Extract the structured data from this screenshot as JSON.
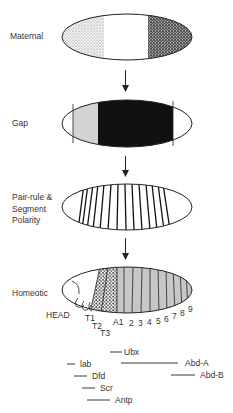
{
  "stages": [
    {
      "label": "Maternal",
      "regions": [
        "light-stipple",
        "white",
        "dark-stipple"
      ]
    },
    {
      "label": "Gap",
      "regions": [
        "white",
        "light-gray",
        "black",
        "white"
      ]
    },
    {
      "label": "Pair-rule & Segment Polarity",
      "label_lines": [
        "Pair-rule &",
        "Segment",
        "Polarity"
      ],
      "stripes": 14
    },
    {
      "label": "Homeotic",
      "regions": [
        "head-white",
        "thorax-stipple",
        "abdomen-gray"
      ]
    }
  ],
  "segments": {
    "head": "HEAD",
    "thoracic": [
      "T1",
      "T2",
      "T3"
    ],
    "abdominal": [
      "A1",
      "2",
      "3",
      "4",
      "5",
      "6",
      "7",
      "8",
      "9"
    ]
  },
  "genes": [
    {
      "name": "Ubx"
    },
    {
      "name": "lab"
    },
    {
      "name": "Abd-A"
    },
    {
      "name": "Dfd"
    },
    {
      "name": "Abd-B"
    },
    {
      "name": "Scr"
    },
    {
      "name": "Antp"
    }
  ],
  "colors": {
    "outline": "#222222",
    "light_stipple": "#d8d8d8",
    "dark_stipple": "#555555",
    "gap_gray": "#d0d0d0",
    "gap_black": "#111111",
    "abdomen_gray": "#c4c4c4"
  }
}
